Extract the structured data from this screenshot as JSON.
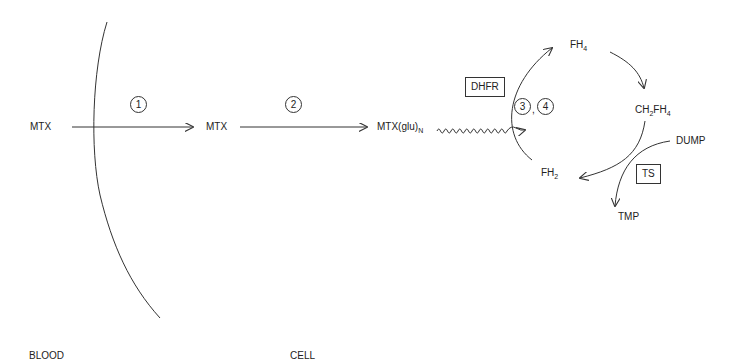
{
  "regions": {
    "blood": "BLOOD",
    "cell": "CELL"
  },
  "species": {
    "mtx_blood": "MTX",
    "mtx_cell": "MTX",
    "mtx_glu_base": "MTX(glu)",
    "mtx_glu_sub": "N",
    "fh4_base": "FH",
    "fh4_sub": "4",
    "ch2fh4_a": "CH",
    "ch2fh4_sub1": "2",
    "ch2fh4_b": "FH",
    "ch2fh4_sub2": "4",
    "fh2_base": "FH",
    "fh2_sub": "2",
    "dump": "DUMP",
    "tmp": "TMP"
  },
  "enzymes": {
    "dhfr": "DHFR",
    "ts": "TS"
  },
  "steps": {
    "step1": "1",
    "step2": "2",
    "step3": "3",
    "step4": "4",
    "separator": ","
  },
  "colors": {
    "line": "#333333",
    "text": "#222222",
    "background": "#ffffff"
  }
}
